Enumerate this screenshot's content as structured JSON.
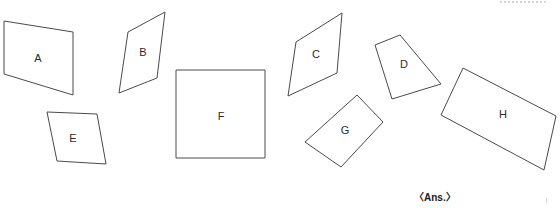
{
  "page": {
    "background_color": "#ffffff",
    "stroke_color": "#4a4a4a",
    "label_color": "#2b2b2b",
    "width": 560,
    "height": 208
  },
  "figures": [
    {
      "id": "shape-a",
      "label": "A",
      "kind": "quadrilateral",
      "points": "4,21 73,32 73,95 4,74",
      "label_x": 38,
      "label_y": 59
    },
    {
      "id": "shape-b",
      "label": "B",
      "kind": "quadrilateral",
      "points": "165,12 157,78 119,93 128,32",
      "label_x": 143,
      "label_y": 53
    },
    {
      "id": "shape-c",
      "label": "C",
      "kind": "quadrilateral",
      "points": "342,13 337,73 288,96 296,42",
      "label_x": 316,
      "label_y": 55
    },
    {
      "id": "shape-d",
      "label": "D",
      "kind": "quadrilateral",
      "points": "400,35 441,84 392,99 375,45",
      "label_x": 404,
      "label_y": 65
    },
    {
      "id": "shape-e",
      "label": "E",
      "kind": "quadrilateral",
      "points": "47,112 97,114 106,164 57,161",
      "label_x": 73,
      "label_y": 139
    },
    {
      "id": "shape-f",
      "label": "F",
      "kind": "square",
      "points": "176,70 265,70 265,158 176,158",
      "label_x": 221,
      "label_y": 117
    },
    {
      "id": "shape-g",
      "label": "G",
      "kind": "rectangle",
      "points": "357,95 383,122 341,167 305,142",
      "label_x": 345,
      "label_y": 131
    },
    {
      "id": "shape-h",
      "label": "H",
      "kind": "rectangle",
      "points": "463,68 556,116 544,170 441,115",
      "label_x": 503,
      "label_y": 115
    }
  ],
  "annotations": {
    "answer_note": "〈Ans.〉"
  }
}
